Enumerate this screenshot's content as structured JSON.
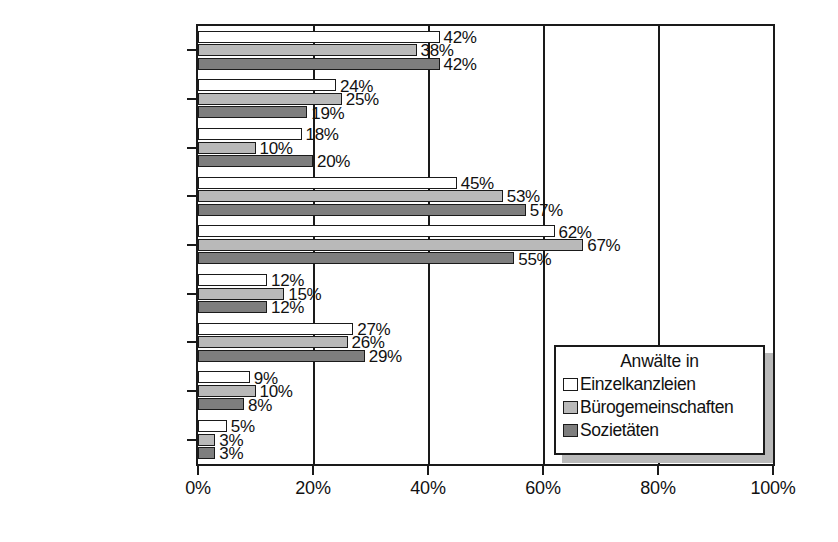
{
  "chart_data": {
    "type": "bar",
    "orientation": "horizontal",
    "title": "",
    "xlabel": "",
    "ylabel": "",
    "xlim": [
      0,
      100
    ],
    "xticks": [
      0,
      20,
      40,
      60,
      80,
      100
    ],
    "xtick_labels": [
      "0%",
      "20%",
      "40%",
      "60%",
      "80%",
      "100%"
    ],
    "grid": true,
    "legend_position": "bottom-right",
    "legend_title": "Anwälte in",
    "value_suffix": "%",
    "categories": [
      "Fachzeitschriften",
      "Bücher",
      "Schulungen",
      "Kollegen",
      "Freunde",
      "Online-Dienste",
      "Werbematerial",
      "Messen",
      "Sonstiges"
    ],
    "series": [
      {
        "name": "Einzelkanzleien",
        "color": "#ffffff",
        "values": [
          42,
          24,
          18,
          45,
          62,
          12,
          27,
          9,
          5
        ],
        "labels": [
          "42%",
          "24%",
          "18%",
          "45%",
          "62%",
          "12%",
          "27%",
          "9%",
          "5%"
        ]
      },
      {
        "name": "Bürogemeinschaften",
        "color": "#b9b9b9",
        "values": [
          38,
          25,
          10,
          53,
          67,
          15,
          26,
          10,
          3
        ],
        "labels": [
          "38%",
          "25%",
          "10%",
          "53%",
          "67%",
          "15%",
          "26%",
          "10%",
          "3%"
        ]
      },
      {
        "name": "Sozietäten",
        "color": "#7e7e7e",
        "values": [
          42,
          19,
          20,
          57,
          55,
          12,
          29,
          8,
          3
        ],
        "labels": [
          "42%",
          "19%",
          "20%",
          "57%",
          "55%",
          "12%",
          "29%",
          "8%",
          "3%"
        ]
      }
    ]
  }
}
